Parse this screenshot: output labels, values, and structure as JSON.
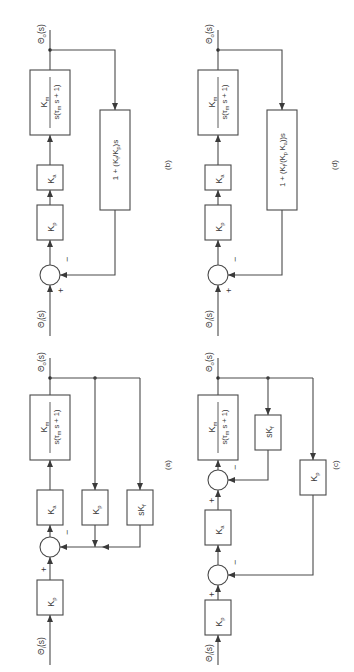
{
  "figure": {
    "orientation": "rotated-90-ccw",
    "panels": [
      {
        "id": "a",
        "caption": "(a)",
        "input_label": "Θi(s)",
        "output_label": "Θo(s)",
        "forward_blocks": [
          "Kp",
          "Ka",
          "Km / s(τm s + 1)"
        ],
        "feedback_blocks": [
          "Kp",
          "sKf"
        ],
        "summing_junctions": [
          {
            "plus": "+",
            "minus": "−"
          }
        ]
      },
      {
        "id": "b",
        "caption": "(b)",
        "input_label": "Θi(s)",
        "output_label": "Θo(s)",
        "forward_blocks": [
          "Kp",
          "Ka",
          "Km / s(τm s + 1)"
        ],
        "feedback_blocks": [
          "1 + (Kf/Kp)s"
        ],
        "summing_junctions": [
          {
            "plus": "+",
            "minus": "−"
          }
        ]
      },
      {
        "id": "c",
        "caption": "(c)",
        "input_label": "Θi(s)",
        "output_label": "Θo(s)",
        "forward_blocks": [
          "Kp",
          "Ka",
          "Km / s(τm s + 1)"
        ],
        "feedback_blocks": [
          "sKf",
          "Kp"
        ],
        "summing_junctions": [
          {
            "plus": "+",
            "minus": "−"
          },
          {
            "plus": "+",
            "minus": "−"
          }
        ]
      },
      {
        "id": "d",
        "caption": "(d)",
        "input_label": "Θi(s)",
        "output_label": "Θo(s)",
        "forward_blocks": [
          "Kp",
          "Ka",
          "Km / s(τm s + 1)"
        ],
        "feedback_blocks": [
          "1 + (Kf/(Kp Ka))s"
        ],
        "summing_junctions": [
          {
            "plus": "+",
            "minus": "−"
          }
        ]
      }
    ]
  },
  "labels": {
    "theta_i": "Θ",
    "theta_i_sub": "i",
    "theta_o": "Θ",
    "theta_o_sub": "o",
    "s_paren": "(s)",
    "K": "K",
    "sub_p": "p",
    "sub_a": "a",
    "sub_m": "m",
    "sub_f": "f",
    "sK": "sK",
    "tf_den_pre": "s(τ",
    "tf_den_post": " s + 1)",
    "plus": "+",
    "minus": "−",
    "fb_b_text_pre": "1 + (K",
    "fb_b_text_mid": "/K",
    "fb_b_text_post": ")s",
    "fb_d_text_pre": "1 + (K",
    "fb_d_text_mid": "/(K",
    "fb_d_text_mid2": " K",
    "fb_d_text_post": "))s",
    "cap_a": "(a)",
    "cap_b": "(b)",
    "cap_c": "(c)",
    "cap_d": "(d)"
  },
  "colors": {
    "line": "#4a4a4a",
    "text": "#3a3a3a",
    "background": "#ffffff"
  }
}
